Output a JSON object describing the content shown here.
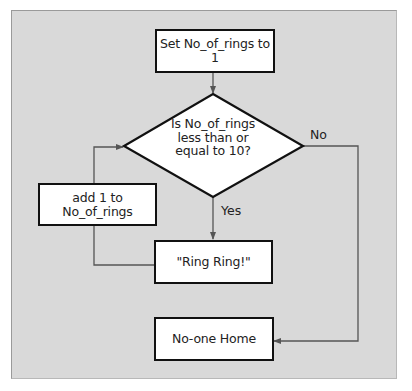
{
  "colors": {
    "background": "#d9d9d9",
    "box_fill": "#ffffff",
    "box_border": "#111111",
    "connector": "#555555",
    "text": "#222222"
  },
  "flowchart": {
    "nodes": {
      "start": {
        "type": "process",
        "text": "Set No_of_rings to 1"
      },
      "decision": {
        "type": "decision",
        "lines": [
          "Is No_of_rings",
          "less than or",
          "equal to 10?"
        ]
      },
      "increment": {
        "type": "process",
        "lines": [
          "add 1 to",
          "No_of_rings"
        ]
      },
      "ring": {
        "type": "process",
        "text": "\"Ring Ring!\""
      },
      "end": {
        "type": "process",
        "text": "No-one Home"
      }
    },
    "edges": [
      {
        "from": "start",
        "to": "decision",
        "label": ""
      },
      {
        "from": "decision",
        "to": "ring",
        "label": "Yes"
      },
      {
        "from": "ring",
        "to": "increment",
        "label": ""
      },
      {
        "from": "increment",
        "to": "decision",
        "label": ""
      },
      {
        "from": "decision",
        "to": "end",
        "label": "No"
      }
    ],
    "labels": {
      "yes": "Yes",
      "no": "No"
    }
  }
}
